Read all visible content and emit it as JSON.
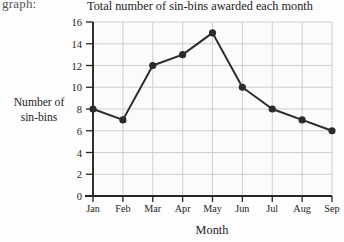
{
  "page": {
    "margin_fragment": "graph:"
  },
  "chart_data": {
    "type": "line",
    "title": "Total number of sin-bins awarded each month",
    "xlabel": "Month",
    "ylabel": "Number of sin-bins",
    "ylabel_lines": [
      "Number of",
      "sin-bins"
    ],
    "categories": [
      "Jan",
      "Feb",
      "Mar",
      "Apr",
      "May",
      "Jun",
      "Jul",
      "Aug",
      "Sep"
    ],
    "values": [
      8,
      7,
      12,
      13,
      15,
      10,
      8,
      7,
      6
    ],
    "ylim": [
      0,
      16
    ],
    "ytick_values": [
      0,
      2,
      4,
      6,
      8,
      10,
      12,
      14,
      16
    ],
    "ytick_labels": [
      "0",
      "2",
      "4",
      "6",
      "8",
      "10",
      "12",
      "14",
      "16"
    ],
    "grid": true,
    "legend": "none",
    "marker": "filled-circle",
    "line_color": "#2b2b2b",
    "marker_color": "#2b2b2b",
    "grid_color": "#c9c9c9",
    "axis_color": "#262626",
    "plot_background": "#fbfbfb"
  }
}
